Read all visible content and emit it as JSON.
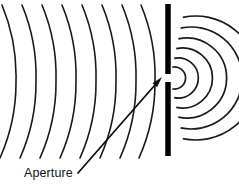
{
  "figure": {
    "type": "physics-diagram",
    "width": 239,
    "height": 189,
    "background_color": "#ffffff",
    "ink_color": "#111111"
  },
  "label": {
    "aperture_text": "Aperture"
  },
  "barrier": {
    "name": "barrier-wall",
    "color": "#000000",
    "x": 168,
    "thickness": 5.5,
    "top": 4,
    "bottom": 156,
    "gap_top": 74,
    "gap_bottom": 82,
    "upper_segment": {
      "y1": 4,
      "y2": 74
    },
    "lower_segment": {
      "y1": 82,
      "y2": 156
    }
  },
  "aperture": {
    "name": "aperture-gap",
    "center_x": 168,
    "center_y": 78,
    "height": 8
  },
  "incident_waves": {
    "name": "incident-plane-wavefronts",
    "count": 8,
    "stroke_width": 1.6,
    "arc_radius": 185,
    "top_y": 5,
    "bottom_y": 158,
    "mid_y": 81,
    "mid_x_positions": [
      16,
      36,
      56,
      76,
      96,
      116,
      136,
      155
    ],
    "top_offset": 14,
    "bottom_offset": 16
  },
  "diffracted_waves": {
    "name": "diffracted-circular-wavefronts",
    "count": 6,
    "stroke_width": 1.7,
    "center_x": 170,
    "center_y": 78,
    "radii": [
      11,
      20,
      30,
      40,
      51,
      62
    ],
    "start_angle_deg": -78,
    "end_angle_deg": 78
  },
  "leader": {
    "name": "aperture-leader-arrow",
    "start_x": 78,
    "start_y": 173,
    "end_x": 162,
    "end_y": 77,
    "head_length": 11,
    "head_width": 6
  },
  "caption_position": {
    "left": 24,
    "top": 167
  }
}
